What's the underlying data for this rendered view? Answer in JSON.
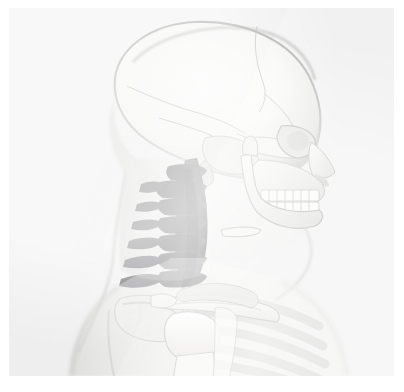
{
  "image": {
    "kind": "medical-anatomical-render",
    "view": "lateral right profile",
    "subject": "human head, neck and shoulder girdle",
    "alt_text": "Grayscale anatomical rendering, right lateral view of a human skull, cervical spine, clavicle, scapula and upper ribs seen through translucent soft tissue",
    "background_color": "#f1f1f1",
    "margin_color": "#ffffff",
    "panel": {
      "x": 9,
      "y": 8,
      "width": 385,
      "height": 368
    }
  },
  "palette": {
    "bone_light": "#fbfbfa",
    "bone_mid": "#e6e5e2",
    "bone_shadow": "#c9c8c4",
    "outline": "#9e9e9c",
    "soft_tissue": "#e2e2e0",
    "soft_tissue_edge": "#b9b9b7",
    "highlight_spine": "#6e6e70",
    "highlight_spine_dark": "#4e4e52",
    "rib_gray": "#cfcfcc",
    "suture_line": "#a7a7a4"
  },
  "structures": [
    {
      "id": "cranium",
      "label": "Cranial vault (frontal, parietal, occipital)",
      "tone": "bone_light"
    },
    {
      "id": "coronal-suture",
      "label": "Coronal suture",
      "tone": "suture_line"
    },
    {
      "id": "lambdoid-suture",
      "label": "Lambdoid suture",
      "tone": "suture_line"
    },
    {
      "id": "squamous-suture",
      "label": "Squamous suture",
      "tone": "suture_line"
    },
    {
      "id": "temporal-bone",
      "label": "Temporal bone",
      "tone": "bone_mid"
    },
    {
      "id": "orbit",
      "label": "Orbital cavity",
      "tone": "bone_shadow"
    },
    {
      "id": "zygomatic-arch",
      "label": "Zygomatic arch",
      "tone": "bone_mid"
    },
    {
      "id": "nasal-bone",
      "label": "Nasal bone",
      "tone": "bone_light"
    },
    {
      "id": "maxilla",
      "label": "Maxilla",
      "tone": "bone_light"
    },
    {
      "id": "upper-teeth",
      "label": "Maxillary teeth",
      "tone": "bone_light"
    },
    {
      "id": "lower-teeth",
      "label": "Mandibular teeth",
      "tone": "bone_light"
    },
    {
      "id": "mandible",
      "label": "Mandible",
      "tone": "bone_light"
    },
    {
      "id": "hyoid",
      "label": "Hyoid bone",
      "tone": "bone_mid"
    },
    {
      "id": "cervical-spine",
      "label": "Cervical vertebrae C1-C7",
      "tone": "highlight_spine"
    },
    {
      "id": "clavicle",
      "label": "Clavicle",
      "tone": "bone_light"
    },
    {
      "id": "scapula",
      "label": "Scapula",
      "tone": "bone_mid"
    },
    {
      "id": "humerus-head",
      "label": "Head of humerus",
      "tone": "bone_light"
    },
    {
      "id": "ribs",
      "label": "Upper ribs",
      "tone": "rib_gray"
    },
    {
      "id": "sternum",
      "label": "Sternum / manubrium",
      "tone": "bone_mid"
    },
    {
      "id": "soft-tissue",
      "label": "Translucent soft tissue silhouette",
      "tone": "soft_tissue"
    }
  ],
  "cervical_vertebrae": [
    {
      "level": "C1",
      "name": "Atlas"
    },
    {
      "level": "C2",
      "name": "Axis"
    },
    {
      "level": "C3",
      "name": "Cervical vertebra 3"
    },
    {
      "level": "C4",
      "name": "Cervical vertebra 4"
    },
    {
      "level": "C5",
      "name": "Cervical vertebra 5"
    },
    {
      "level": "C6",
      "name": "Cervical vertebra 6"
    },
    {
      "level": "C7",
      "name": "Vertebra prominens"
    }
  ]
}
